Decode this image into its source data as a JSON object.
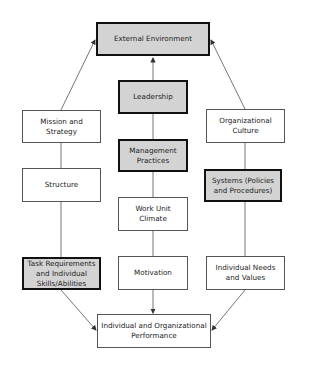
{
  "diagram": {
    "nodes": {
      "external_environment": {
        "label": "External Environment",
        "highlighted": true
      },
      "leadership": {
        "label": "Leadership",
        "highlighted": true
      },
      "mission_strategy": {
        "label": "Mission and Strategy",
        "highlighted": false
      },
      "organizational_culture": {
        "label": "Organizational Culture",
        "highlighted": false
      },
      "management_practices": {
        "label": "Management Practices",
        "highlighted": true
      },
      "structure": {
        "label": "Structure",
        "highlighted": false
      },
      "systems": {
        "label": "Systems (Policies and Procedures)",
        "highlighted": true
      },
      "work_unit_climate": {
        "label": "Work Unit Climate",
        "highlighted": false
      },
      "task_requirements": {
        "label": "Task Requirements and Individual Skills/Abilities",
        "highlighted": true
      },
      "motivation": {
        "label": "Motivation",
        "highlighted": false
      },
      "individual_needs": {
        "label": "Individual Needs and Values",
        "highlighted": false
      },
      "performance": {
        "label": "Individual and Organizational Performance",
        "highlighted": false
      }
    },
    "edges": [
      {
        "from": "leadership",
        "to": "external_environment",
        "arrow": true
      },
      {
        "from": "mission_strategy",
        "to": "external_environment",
        "arrow": true
      },
      {
        "from": "organizational_culture",
        "to": "external_environment",
        "arrow": true
      },
      {
        "from": "leadership",
        "to": "management_practices",
        "arrow": false
      },
      {
        "from": "management_practices",
        "to": "work_unit_climate",
        "arrow": false
      },
      {
        "from": "work_unit_climate",
        "to": "motivation",
        "arrow": false
      },
      {
        "from": "motivation",
        "to": "performance",
        "arrow": true
      },
      {
        "from": "mission_strategy",
        "to": "structure",
        "arrow": false
      },
      {
        "from": "structure",
        "to": "task_requirements",
        "arrow": false
      },
      {
        "from": "task_requirements",
        "to": "performance",
        "arrow": true
      },
      {
        "from": "organizational_culture",
        "to": "systems",
        "arrow": false
      },
      {
        "from": "systems",
        "to": "individual_needs",
        "arrow": false
      },
      {
        "from": "individual_needs",
        "to": "performance",
        "arrow": true
      }
    ],
    "colors": {
      "highlight_fill": "#d3d3d3",
      "plain_fill": "#ffffff",
      "line": "#555555"
    }
  }
}
